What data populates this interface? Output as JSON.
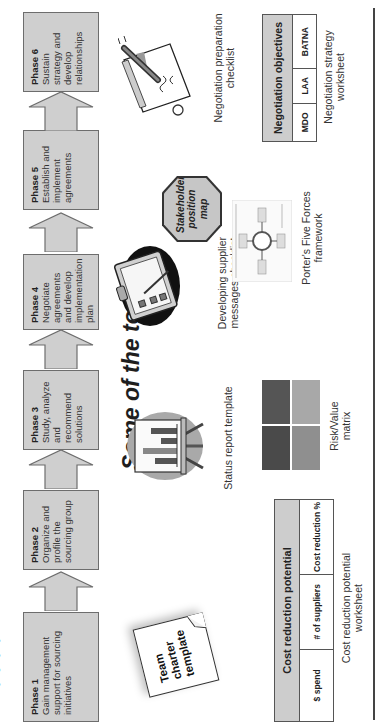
{
  "slide": {
    "title_fragment": "•  •  •  •",
    "phases": [
      {
        "title": "Phase 1",
        "text": "Gain management support for sourcing initiatives"
      },
      {
        "title": "Phase 2",
        "text": "Organize and profile the sourcing group"
      },
      {
        "title": "Phase 3",
        "text": "Study, analyze and recommend solutions"
      },
      {
        "title": "Phase 4",
        "text": "Negotiate agreements and develop implementation plan"
      },
      {
        "title": "Phase 5",
        "text": "Establish and implement agreements"
      },
      {
        "title": "Phase 6",
        "text": "Sustain strategy and develop relationships"
      }
    ],
    "tools_heading": "Some of the tools",
    "tools": {
      "team_charter": {
        "icon": "note-page-icon",
        "label": "Team charter template"
      },
      "status_report": {
        "icon": "easel-chart-icon",
        "caption": "Status report template"
      },
      "supplier_messages": {
        "icon": "clipboard-icon",
        "caption": "Developing supplier messages checklist"
      },
      "stakeholder_map": {
        "icon": "octagon-icon",
        "label": "Stakeholder position map"
      },
      "negotiation_checklist": {
        "icon": "pen-paper-icon",
        "caption": "Negotiation preparation checklist"
      },
      "cost_worksheet": {
        "header": "Cost reduction potential",
        "columns": [
          "$ spend",
          "# of suppliers",
          "Cost reduction %"
        ],
        "caption": "Cost reduction potential worksheet"
      },
      "risk_value_matrix": {
        "caption": "Risk/Value matrix",
        "cells": [
          "#4a4a4a",
          "#a8a8a8",
          "#5c5c5c",
          "#8f8f8f"
        ]
      },
      "porters": {
        "icon": "five-forces-diagram-icon",
        "caption": "Porter's Five Forces framework"
      },
      "negotiation_worksheet": {
        "header": "Negotiation objectives",
        "columns": [
          "MDO",
          "LAA",
          "BATNA"
        ],
        "caption": "Negotiation strategy worksheet"
      }
    },
    "colors": {
      "phase_fill": "#cfcfcf",
      "phase_border": "#6d6d6d",
      "table_header": "#cdcdcd",
      "octagon_fill": "#c6c6c6"
    }
  }
}
